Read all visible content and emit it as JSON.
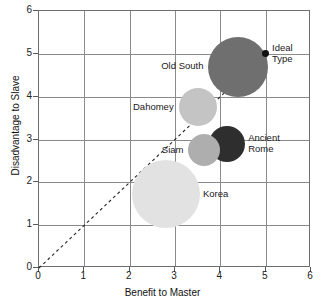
{
  "chart_data": {
    "type": "scatter",
    "title": "",
    "xlabel": "Benefit to Master",
    "ylabel": "Disadvantage to Slave",
    "xlim": [
      0,
      6
    ],
    "ylim": [
      0,
      6
    ],
    "xticks": [
      "0",
      "1",
      "2",
      "3",
      "4",
      "5",
      "6"
    ],
    "yticks": [
      "0",
      "1",
      "2",
      "3",
      "4",
      "5",
      "6"
    ],
    "grid": true,
    "legend": "none",
    "reference_line": {
      "name": "diagonal-dashed-line",
      "style": "dashed",
      "from": [
        0,
        0
      ],
      "to": [
        5,
        5
      ]
    },
    "points": [
      {
        "label": "Old South",
        "x": 4.4,
        "y": 4.7,
        "size": 30,
        "color": "#6f6f6f",
        "label_position": "left"
      },
      {
        "label": "Dahomey",
        "x": 3.5,
        "y": 3.75,
        "size": 19,
        "color": "#c4c4c4",
        "label_position": "left"
      },
      {
        "label": "Ancient\nRome",
        "x": 4.15,
        "y": 2.9,
        "size": 18,
        "color": "#2e2e2e",
        "label_position": "right"
      },
      {
        "label": "Siam",
        "x": 3.65,
        "y": 2.75,
        "size": 16,
        "color": "#aeaeae",
        "label_position": "left"
      },
      {
        "label": "Korea",
        "x": 2.8,
        "y": 1.72,
        "size": 34,
        "color": "#e2e2e2",
        "label_position": "right"
      },
      {
        "label": "Ideal\nType",
        "x": 5.0,
        "y": 5.0,
        "size": 3.4,
        "color": "#111111",
        "label_position": "right"
      }
    ]
  }
}
